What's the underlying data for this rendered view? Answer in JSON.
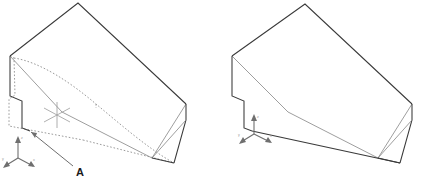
{
  "drawing": {
    "title": "Isometric wedge part - two views",
    "background_color": "#ffffff",
    "visible_edge_color": "#3a3a3a",
    "hidden_edge_color": "#8e8e8e",
    "annotation_color": "#1a1a1a",
    "axis_color": "#6f6f6f",
    "ucs_marker_color": "#9a9a9a"
  },
  "left_view": {
    "name": "left-isometric-view",
    "description": "Wedge solid with hidden lines shown as dashes",
    "callout": {
      "label": "A",
      "label_x": 76,
      "label_y": 174
    },
    "ucs_marker": {
      "name": "ucs-crosshair",
      "spokes": 6
    },
    "axis_triad": {
      "labels": {
        "x": "x",
        "y": "y",
        "z": "z"
      }
    }
  },
  "right_view": {
    "name": "right-isometric-view",
    "description": "Same wedge solid with hidden lines removed",
    "axis_triad": {
      "labels": {
        "x": "x",
        "y": "y",
        "z": "z"
      }
    }
  }
}
